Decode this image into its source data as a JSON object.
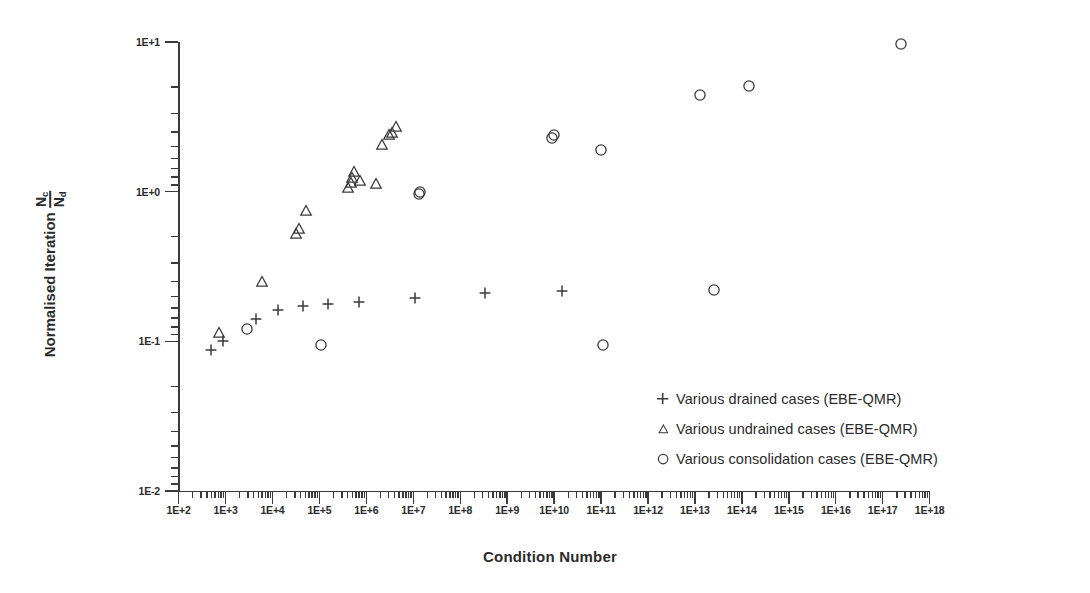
{
  "chart_data": {
    "type": "scatter",
    "title": "",
    "xlabel": "Condition Number",
    "ylabel": "Normalised Iteration",
    "ylabel_fraction": {
      "numerator": "N",
      "numerator_sub": "c",
      "denominator": "N",
      "denominator_sub": "d"
    },
    "xscale": "log",
    "yscale": "log",
    "xlim": [
      100,
      1e+18
    ],
    "ylim": [
      0.01,
      10
    ],
    "grid": false,
    "legend_position": "lower-right-inside",
    "xticklabels": [
      "1E+2",
      "1E+3",
      "1E+4",
      "1E+5",
      "1E+6",
      "1E+7",
      "1E+8",
      "1E+9",
      "1E+10",
      "1E+11",
      "1E+12",
      "1E+13",
      "1E+14",
      "1E+15",
      "1E+16",
      "1E+17",
      "1E+18"
    ],
    "xtickvalues": [
      100.0,
      1000.0,
      10000.0,
      100000.0,
      1000000.0,
      10000000.0,
      100000000.0,
      1000000000.0,
      10000000000.0,
      100000000000.0,
      1000000000000.0,
      10000000000000.0,
      100000000000000.0,
      1000000000000000.0,
      1e+16,
      1e+17,
      1e+18
    ],
    "yticklabels": [
      "1E+1",
      "1E+0",
      "1E-1",
      "1E-2"
    ],
    "ytickvalues": [
      10,
      1,
      0.1,
      0.01
    ],
    "minor_ticks": true,
    "series": [
      {
        "name": "Various drained cases (EBE-QMR)",
        "marker": "plus",
        "color": "#3a3a3a",
        "points": [
          [
            500.0,
            0.0876
          ],
          [
            870.0,
            0.101
          ],
          [
            4400.0,
            0.142
          ],
          [
            13000.0,
            0.1625
          ],
          [
            45000.0,
            0.1725
          ],
          [
            150000.0,
            0.177
          ],
          [
            710000.0,
            0.184
          ],
          [
            11000000.0,
            0.196
          ],
          [
            330000000.0,
            0.209
          ],
          [
            15000000000.0,
            0.216
          ]
        ]
      },
      {
        "name": "Various undrained cases (EBE-QMR)",
        "marker": "triangle",
        "color": "#3a3a3a",
        "points": [
          [
            740.0,
            0.113
          ],
          [
            6000.0,
            0.25
          ],
          [
            32000.0,
            0.52
          ],
          [
            36000.0,
            0.56
          ],
          [
            53000.0,
            0.74
          ],
          [
            410000.0,
            1.05
          ],
          [
            460000.0,
            1.15
          ],
          [
            490000.0,
            1.23
          ],
          [
            540000.0,
            1.36
          ],
          [
            730000.0,
            1.18
          ],
          [
            1600000.0,
            1.12
          ],
          [
            2200000.0,
            2.05
          ],
          [
            3100000.0,
            2.4
          ],
          [
            3600000.0,
            2.45
          ],
          [
            4200000.0,
            2.7
          ]
        ]
      },
      {
        "name": "Various consolidation cases (EBE-QMR)",
        "marker": "circle",
        "color": "#3a3a3a",
        "points": [
          [
            2800.0,
            0.121
          ],
          [
            110000.0,
            0.094
          ],
          [
            13000000.0,
            0.96
          ],
          [
            14000000.0,
            0.99
          ],
          [
            8900000000.0,
            2.3
          ],
          [
            9800000000.0,
            2.4
          ],
          [
            100000000000.0,
            1.9
          ],
          [
            110000000000.0,
            0.094
          ],
          [
            13000000000000.0,
            4.4
          ],
          [
            25000000000000.0,
            0.22
          ],
          [
            140000000000000.0,
            5.1
          ],
          [
            2.4e+17,
            9.7
          ]
        ]
      }
    ]
  },
  "legend": {
    "rows": [
      {
        "marker": "plus",
        "label": "Various drained cases (EBE-QMR)"
      },
      {
        "marker": "triangle",
        "label": "Various undrained cases (EBE-QMR)"
      },
      {
        "marker": "circle",
        "label": "Various consolidation cases (EBE-QMR)"
      }
    ]
  },
  "axes": {
    "x_title": "Condition Number",
    "y_title": "Normalised Iteration"
  },
  "colors": {
    "ink": "#3a3a3a",
    "text": "#2b2b2b"
  }
}
